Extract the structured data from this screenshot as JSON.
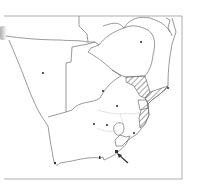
{
  "map": {
    "region": "Southern Africa",
    "type": "species distribution map",
    "colors": {
      "border": "#6e6e6e",
      "frame": "#8a8a8a",
      "hatch": "#5a5a5a",
      "dot": "#333333",
      "arrow": "#333333",
      "faint_border": "#cfcfcf",
      "background": "#ffffff"
    },
    "features": {
      "hatched_ranges": 2,
      "boxed_area": 1,
      "capital_dots": 8,
      "arrow_indicator": 1
    }
  }
}
